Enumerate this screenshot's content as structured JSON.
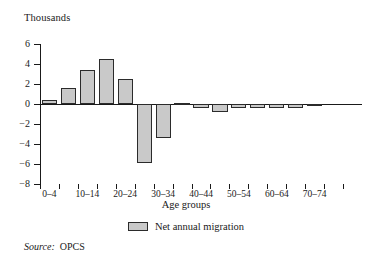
{
  "chart_data": {
    "type": "bar",
    "title": "",
    "unit_label": "Thousands",
    "xlabel": "Age groups",
    "ylabel": "",
    "ylim": [
      -8,
      6
    ],
    "ytick_values": [
      6,
      4,
      2,
      0,
      -2,
      -4,
      -6,
      -8
    ],
    "ytick_labels": [
      "6",
      "4",
      "2",
      "0",
      "−2",
      "−4",
      "−6",
      "−8"
    ],
    "grid": false,
    "legend_position": "below-axis-center",
    "categories": [
      "0–4",
      "5–9",
      "10–14",
      "15–19",
      "20–24",
      "25–29",
      "30–34",
      "35–39",
      "40–44",
      "45–49",
      "50–54",
      "55–59",
      "60–64",
      "65–69",
      "70–74",
      "76+"
    ],
    "visible_tick_labels": [
      "0–4",
      "10–14",
      "20–24",
      "30–34",
      "40–44",
      "50–54",
      "60–64",
      "70–74",
      "76+"
    ],
    "series": [
      {
        "name": "Net annual migration",
        "values": [
          0.4,
          1.6,
          3.4,
          4.5,
          2.5,
          -5.9,
          -3.4,
          0.1,
          -0.4,
          -0.8,
          -0.4,
          -0.4,
          -0.4,
          -0.4,
          -0.2,
          0.0
        ]
      }
    ],
    "colors": {
      "bar_fill": "#c9c9c9",
      "bar_border": "#2b2b2b",
      "axis": "#1a1a1a",
      "text": "#1a1a1a",
      "background": "#ffffff"
    }
  },
  "legend": {
    "entries": [
      {
        "label": "Net annual migration",
        "swatch": "#c9c9c9"
      }
    ]
  },
  "source": {
    "key": "Source:",
    "value": "OPCS"
  }
}
